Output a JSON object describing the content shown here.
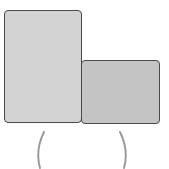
{
  "diagram": {
    "shapes": [
      {
        "id": "tall-rectangle",
        "fill": "#d3d3d3",
        "stroke": "#4a4a4a"
      },
      {
        "id": "short-rectangle",
        "fill": "#c4c4c4",
        "stroke": "#4a4a4a"
      }
    ],
    "brackets": {
      "left": "(",
      "right": ")",
      "color": "#9a9a9a"
    }
  }
}
